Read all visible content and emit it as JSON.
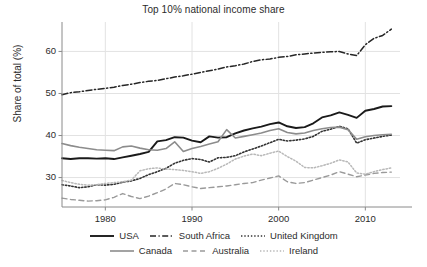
{
  "chart_data": {
    "type": "line",
    "title": "Top 10% national income share",
    "xlabel": "",
    "ylabel": "Share of total (%)",
    "xlim": [
      1975,
      2014
    ],
    "ylim": [
      23,
      67
    ],
    "xticks": [
      1980,
      1990,
      2000,
      2010
    ],
    "yticks": [
      30,
      40,
      50,
      60
    ],
    "grid": true,
    "legend_position": "below",
    "x": [
      1975,
      1976,
      1977,
      1978,
      1979,
      1980,
      1981,
      1982,
      1983,
      1984,
      1985,
      1986,
      1987,
      1988,
      1989,
      1990,
      1991,
      1992,
      1993,
      1994,
      1995,
      1996,
      1997,
      1998,
      1999,
      2000,
      2001,
      2002,
      2003,
      2004,
      2005,
      2006,
      2007,
      2008,
      2009,
      2010,
      2011,
      2012,
      2013
    ],
    "series": [
      {
        "name": "USA",
        "style": "solid",
        "color": "#1a1a1a",
        "width": 1.9,
        "values": [
          34.6,
          34.4,
          34.6,
          34.6,
          34.5,
          34.6,
          34.4,
          34.8,
          35.2,
          35.6,
          36.1,
          38.6,
          38.9,
          39.6,
          39.5,
          38.8,
          38.4,
          39.8,
          39.5,
          39.6,
          40.5,
          41.2,
          41.7,
          42.1,
          42.7,
          43.1,
          42.2,
          41.8,
          42.0,
          42.9,
          44.3,
          44.8,
          45.5,
          44.9,
          44.2,
          45.9,
          46.3,
          46.9,
          47.0
        ]
      },
      {
        "name": "South Africa",
        "style": "dashdot",
        "color": "#262626",
        "width": 1.5,
        "values": [
          49.7,
          50.2,
          50.4,
          50.7,
          51.0,
          51.2,
          51.5,
          51.9,
          52.2,
          52.6,
          52.9,
          53.1,
          53.5,
          53.9,
          54.2,
          54.6,
          55.0,
          55.4,
          55.8,
          56.3,
          56.6,
          57.0,
          57.6,
          58.0,
          58.2,
          58.6,
          58.8,
          59.2,
          59.4,
          59.6,
          59.8,
          59.9,
          60.0,
          59.4,
          59.0,
          61.6,
          63.1,
          63.8,
          65.3
        ]
      },
      {
        "name": "United Kingdom",
        "style": "dotted",
        "color": "#333333",
        "width": 1.6,
        "values": [
          28.3,
          28.0,
          27.6,
          27.8,
          28.3,
          28.2,
          28.4,
          28.9,
          29.2,
          29.8,
          30.7,
          31.4,
          32.2,
          33.4,
          34.1,
          34.5,
          34.3,
          33.7,
          34.7,
          34.8,
          35.2,
          36.1,
          36.8,
          37.5,
          38.3,
          39.1,
          38.7,
          38.9,
          39.2,
          39.8,
          41.0,
          41.5,
          42.2,
          41.6,
          38.2,
          39.0,
          39.4,
          39.8,
          40.1
        ]
      },
      {
        "name": "Canada",
        "style": "solid",
        "color": "#8c8c8c",
        "width": 1.6,
        "values": [
          38.1,
          37.6,
          37.2,
          36.9,
          36.6,
          36.5,
          36.4,
          37.3,
          37.5,
          37.0,
          36.6,
          36.5,
          36.9,
          38.5,
          36.2,
          36.9,
          37.4,
          38.0,
          38.5,
          41.4,
          39.4,
          39.8,
          40.2,
          40.6,
          41.2,
          41.6,
          40.7,
          40.4,
          40.6,
          41.2,
          41.6,
          41.9,
          42.0,
          41.4,
          39.1,
          39.7,
          40.0,
          40.2,
          40.3
        ]
      },
      {
        "name": "Australia",
        "style": "dashed",
        "color": "#9a9a9a",
        "width": 1.4,
        "values": [
          25.1,
          24.8,
          24.6,
          24.4,
          24.5,
          24.7,
          25.3,
          26.2,
          25.5,
          25.0,
          25.6,
          26.4,
          27.3,
          28.6,
          28.3,
          27.8,
          27.4,
          27.6,
          27.8,
          28.0,
          28.3,
          28.6,
          28.8,
          29.4,
          29.9,
          30.4,
          29.0,
          28.6,
          28.8,
          29.4,
          30.0,
          30.6,
          31.4,
          30.8,
          30.2,
          30.6,
          31.0,
          31.2,
          31.3
        ]
      },
      {
        "name": "Ireland",
        "style": "dotted",
        "color": "#b8b8b8",
        "width": 1.5,
        "values": [
          29.3,
          28.8,
          28.4,
          28.2,
          28.3,
          28.6,
          28.8,
          29.0,
          29.4,
          31.6,
          32.1,
          32.3,
          32.0,
          31.9,
          31.7,
          31.4,
          31.0,
          31.4,
          32.2,
          33.2,
          34.4,
          35.1,
          35.6,
          35.2,
          35.8,
          36.3,
          35.0,
          33.9,
          32.4,
          32.3,
          32.8,
          33.4,
          34.2,
          33.7,
          31.1,
          30.8,
          31.4,
          31.9,
          32.3
        ]
      }
    ]
  },
  "legend": {
    "rows": [
      [
        {
          "label": "USA",
          "style": "solid",
          "color": "#1a1a1a",
          "width": 1.9
        },
        {
          "label": "South Africa",
          "style": "dashdot",
          "color": "#262626",
          "width": 1.5
        },
        {
          "label": "United Kingdom",
          "style": "dotted",
          "color": "#333333",
          "width": 1.6
        }
      ],
      [
        {
          "label": "Canada",
          "style": "solid",
          "color": "#8c8c8c",
          "width": 1.6
        },
        {
          "label": "Australia",
          "style": "dashed",
          "color": "#9a9a9a",
          "width": 1.4
        },
        {
          "label": "Ireland",
          "style": "dotted",
          "color": "#b8b8b8",
          "width": 1.5
        }
      ]
    ]
  },
  "axis_style": {
    "axis_color": "#8a8a8a",
    "grid_color": "#e2e2e2",
    "text_color": "#2b2b2b"
  }
}
